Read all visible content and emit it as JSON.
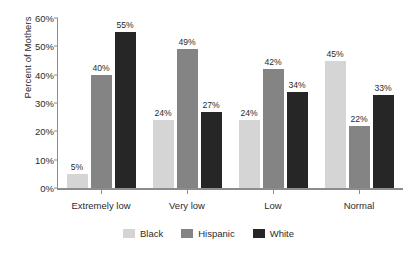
{
  "chart_data": {
    "type": "bar",
    "title": "",
    "subtitle": "",
    "xlabel": "",
    "ylabel": "Percent of Mothers",
    "categories": [
      "Extremely low",
      "Very low",
      "Low",
      "Normal"
    ],
    "series": [
      {
        "name": "Black",
        "color": "#d5d5d5",
        "values": [
          5,
          24,
          24,
          45
        ],
        "labels": [
          "5%",
          "24%",
          "24%",
          "45%"
        ]
      },
      {
        "name": "Hispanic",
        "color": "#848484",
        "values": [
          40,
          49,
          42,
          22
        ],
        "labels": [
          "40%",
          "49%",
          "42%",
          "22%"
        ]
      },
      {
        "name": "White",
        "color": "#262626",
        "values": [
          55,
          27,
          34,
          33
        ],
        "labels": [
          "55%",
          "27%",
          "34%",
          "33%"
        ]
      }
    ],
    "ylim": [
      0,
      60
    ],
    "ytick_values": [
      0,
      10,
      20,
      30,
      40,
      50,
      60
    ],
    "ytick_labels": [
      "0%",
      "10%",
      "20%",
      "30%",
      "40%",
      "50%",
      "60%"
    ],
    "grid": false,
    "legend_position": "bottom",
    "value_labels_shown": true,
    "axis_color": "#8c8c8c",
    "text_color": "#2b2b2b",
    "background": "#ffffff"
  },
  "axis": {
    "y_title": "Percent of Mothers"
  },
  "legend": {
    "entries": [
      {
        "label": "Black"
      },
      {
        "label": "Hispanic"
      },
      {
        "label": "White"
      }
    ]
  }
}
